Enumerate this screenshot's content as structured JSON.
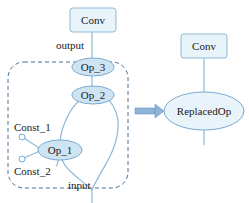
{
  "diagram": {
    "left": {
      "conv": {
        "label": "Conv"
      },
      "output_label": "output",
      "op3": {
        "label": "Op_3"
      },
      "op2": {
        "label": "Op_2"
      },
      "op1": {
        "label": "Op_1"
      },
      "const1": {
        "label": "Const_1"
      },
      "const2": {
        "label": "Const_2"
      },
      "input_label": "input"
    },
    "right": {
      "conv": {
        "label": "Conv"
      },
      "replaced": {
        "label": "ReplacedOp"
      }
    },
    "colors": {
      "box_fill": "#e8f3fa",
      "box_stroke": "#8fb8d6",
      "ellipse_fill": "#cfe4f3",
      "ellipse_stroke": "#7aa9cf",
      "edge": "#8fb8d6",
      "dashed": "#4a6f94",
      "arrow": "#8fb3d9"
    }
  }
}
